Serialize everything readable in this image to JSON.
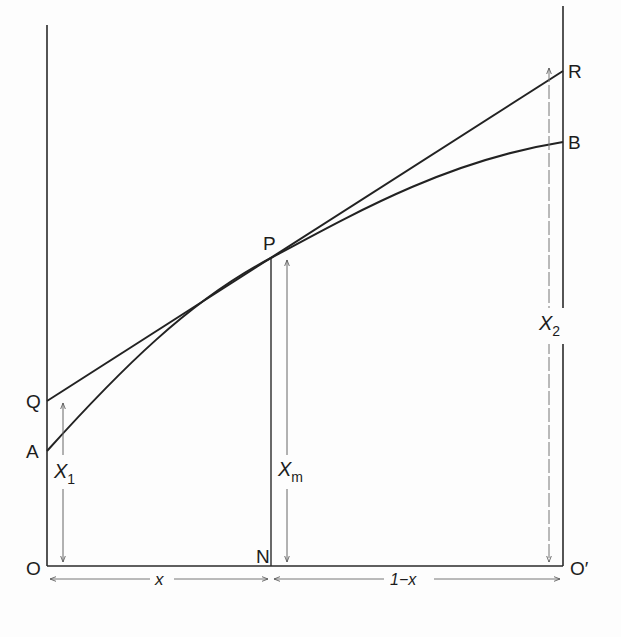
{
  "diagram": {
    "points": {
      "O": "O",
      "O_prime": "O′",
      "N": "N",
      "P": "P",
      "Q": "Q",
      "A": "A",
      "R": "R",
      "B": "B"
    },
    "measures": {
      "X1": {
        "main": "X",
        "sub": "1"
      },
      "Xm": {
        "main": "X",
        "sub": "m"
      },
      "X2": {
        "main": "X",
        "sub": "2"
      },
      "x": "x",
      "one_minus_x": "1−x"
    },
    "colors": {
      "line": "#2a2a2a",
      "arrow": "#6a6a6a",
      "background": "#fdfdfd"
    }
  }
}
